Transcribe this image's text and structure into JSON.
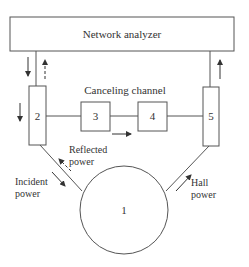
{
  "diagram": {
    "network_analyzer": {
      "label": "Network analyzer"
    },
    "canceling_channel": {
      "label": "Canceling channel"
    },
    "blocks": [
      {
        "id": "2",
        "label": "2"
      },
      {
        "id": "3",
        "label": "3"
      },
      {
        "id": "4",
        "label": "4"
      },
      {
        "id": "5",
        "label": "5"
      }
    ],
    "sample": {
      "id": "1",
      "label": "1"
    },
    "annotations": {
      "incident_line1": "Incident",
      "incident_line2": "power",
      "reflected_line1": "Reflected",
      "reflected_line2": "power",
      "hall_line1": "Hall",
      "hall_line2": "power"
    },
    "colors": {
      "stroke": "#555555",
      "text": "#333333",
      "background": "#ffffff"
    }
  }
}
